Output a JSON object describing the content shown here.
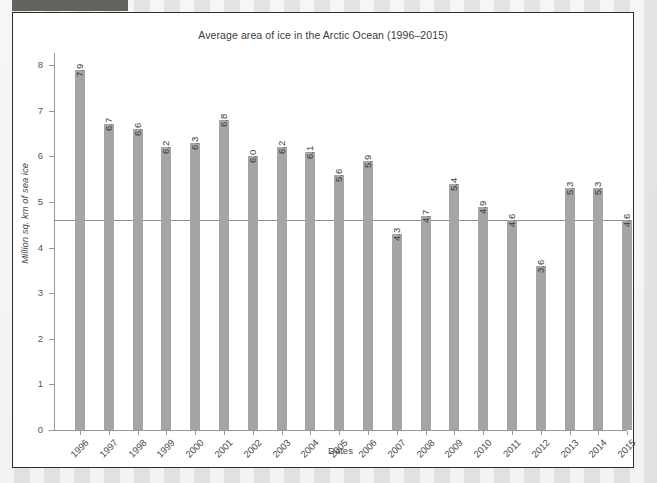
{
  "window": {
    "toolbar_fragment": "toolbar-strip",
    "panel_background": "#ffffff",
    "page_background": "#e8e8e8"
  },
  "chart_data": {
    "type": "bar",
    "title": "Average area of ice in the Arctic Ocean (1996–2015)",
    "xlabel": "Dates",
    "ylabel": "Million sq. km of sea ice",
    "categories": [
      "1996",
      "1997",
      "1998",
      "1999",
      "2000",
      "2001",
      "2002",
      "2003",
      "2004",
      "2005",
      "2006",
      "2007",
      "2008",
      "2009",
      "2010",
      "2011",
      "2012",
      "2013",
      "2014",
      "2015"
    ],
    "values": [
      7.9,
      6.7,
      6.6,
      6.2,
      6.3,
      6.8,
      6.0,
      6.2,
      6.1,
      5.6,
      5.9,
      4.3,
      4.7,
      5.4,
      4.9,
      4.6,
      3.6,
      5.3,
      5.3,
      4.6
    ],
    "value_labels": [
      "7.9",
      "6.7",
      "6.6",
      "6.2",
      "6.3",
      "6.8",
      "6.0",
      "6.2",
      "6.1",
      "5.6",
      "5.9",
      "4.3",
      "4.7",
      "5.4",
      "4.9",
      "4.6",
      "3.6",
      "5.3",
      "5.3",
      "4.6"
    ],
    "ylim": [
      0,
      8.5
    ],
    "yticks": [
      0,
      1,
      2,
      3,
      4,
      5,
      6,
      7,
      8
    ],
    "ytick_labels": [
      "0",
      "1",
      "2",
      "3",
      "4",
      "5",
      "6",
      "7",
      "8"
    ],
    "grid": false,
    "legend": null,
    "bar_color": "#a5a5a5",
    "reference_line": {
      "value": 4.6,
      "color": "#8d8d8d",
      "label": ""
    }
  }
}
